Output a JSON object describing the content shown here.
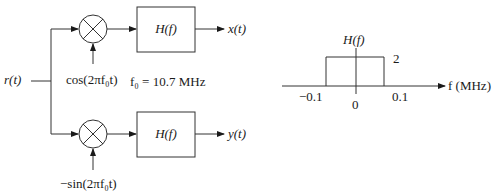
{
  "block_diagram": {
    "input": "r(t)",
    "top_branch": {
      "oscillator": "cos(2πf₀t)",
      "filter": "H(f)",
      "output": "x(t)"
    },
    "bottom_branch": {
      "oscillator": "−sin(2πf₀t)",
      "filter": "H(f)",
      "output": "y(t)"
    },
    "carrier_note": "f₀ = 10.7 MHz"
  },
  "filter_response": {
    "ylabel": "H(f)",
    "amplitude": "2",
    "xlabel": "f (MHz)",
    "ticks": [
      "−0.1",
      "0",
      "0.1"
    ]
  }
}
